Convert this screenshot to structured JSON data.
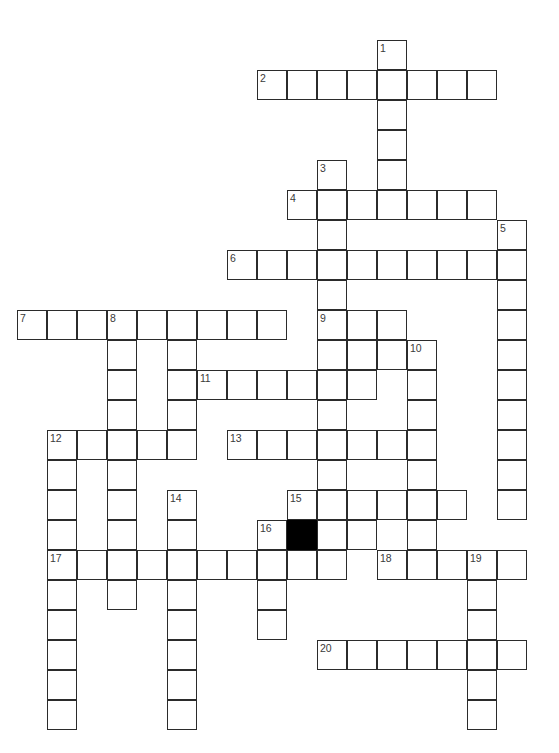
{
  "puzzle": {
    "kind": "crossword-grid",
    "title": "",
    "geometry": {
      "origin_x": 17,
      "origin_y": 40,
      "cell_size": 30,
      "cols": 18,
      "rows": 24,
      "border_color": "#2b2b2b",
      "cell_fill": "#ffffff",
      "block_fill": "#000000",
      "page_background": "#ffffff"
    },
    "entries": [
      {
        "number": "1",
        "direction": "down",
        "row": 0,
        "col": 12,
        "length": 7
      },
      {
        "number": "2",
        "direction": "across",
        "row": 1,
        "col": 8,
        "length": 8
      },
      {
        "number": "3",
        "direction": "down",
        "row": 4,
        "col": 10,
        "length": 8
      },
      {
        "number": "4",
        "direction": "across",
        "row": 5,
        "col": 9,
        "length": 7
      },
      {
        "number": "5",
        "direction": "down",
        "row": 6,
        "col": 16,
        "length": 10
      },
      {
        "number": "6",
        "direction": "across",
        "row": 7,
        "col": 7,
        "length": 10
      },
      {
        "number": "7",
        "direction": "across",
        "row": 9,
        "col": 0,
        "length": 9
      },
      {
        "number": "8",
        "direction": "down",
        "row": 9,
        "col": 3,
        "length": 10
      },
      {
        "number": "9",
        "direction": "down",
        "row": 9,
        "col": 10,
        "length": 10
      },
      {
        "number": "10",
        "direction": "down",
        "row": 10,
        "col": 13,
        "length": 9
      },
      {
        "number": "11",
        "direction": "across",
        "row": 11,
        "col": 6,
        "length": 6
      },
      {
        "number": "12",
        "direction": "across",
        "row": 13,
        "col": 1,
        "length": 5
      },
      {
        "number": "12",
        "direction": "down",
        "row": 13,
        "col": 1,
        "length": 10
      },
      {
        "number": "13",
        "direction": "across",
        "row": 13,
        "col": 7,
        "length": 6
      },
      {
        "number": "14",
        "direction": "down",
        "row": 15,
        "col": 5,
        "length": 10
      },
      {
        "number": "15",
        "direction": "across",
        "row": 15,
        "col": 9,
        "length": 6
      },
      {
        "number": "16",
        "direction": "across",
        "row": 16,
        "col": 8,
        "length": 4
      },
      {
        "number": "17",
        "direction": "across",
        "row": 17,
        "col": 1,
        "length": 10
      },
      {
        "number": "18",
        "direction": "across",
        "row": 17,
        "col": 12,
        "length": 5
      },
      {
        "number": "19",
        "direction": "down",
        "row": 17,
        "col": 15,
        "length": 7
      },
      {
        "number": "20",
        "direction": "across",
        "row": 20,
        "col": 10,
        "length": 7
      }
    ],
    "blocks": [
      {
        "row": 16,
        "col": 9
      }
    ],
    "cells": [
      {
        "row": 0,
        "col": 12,
        "number": "1"
      },
      {
        "row": 1,
        "col": 8,
        "number": "2"
      },
      {
        "row": 1,
        "col": 9
      },
      {
        "row": 1,
        "col": 10
      },
      {
        "row": 1,
        "col": 11
      },
      {
        "row": 1,
        "col": 12
      },
      {
        "row": 1,
        "col": 13
      },
      {
        "row": 1,
        "col": 14
      },
      {
        "row": 1,
        "col": 15
      },
      {
        "row": 2,
        "col": 12
      },
      {
        "row": 3,
        "col": 12
      },
      {
        "row": 4,
        "col": 10,
        "number": "3"
      },
      {
        "row": 4,
        "col": 12
      },
      {
        "row": 5,
        "col": 9,
        "number": "4"
      },
      {
        "row": 5,
        "col": 10
      },
      {
        "row": 5,
        "col": 11
      },
      {
        "row": 5,
        "col": 12
      },
      {
        "row": 5,
        "col": 13
      },
      {
        "row": 5,
        "col": 14
      },
      {
        "row": 5,
        "col": 15
      },
      {
        "row": 6,
        "col": 10
      },
      {
        "row": 6,
        "col": 16,
        "number": "5"
      },
      {
        "row": 7,
        "col": 7,
        "number": "6"
      },
      {
        "row": 7,
        "col": 8
      },
      {
        "row": 7,
        "col": 9
      },
      {
        "row": 7,
        "col": 10
      },
      {
        "row": 7,
        "col": 11
      },
      {
        "row": 7,
        "col": 12
      },
      {
        "row": 7,
        "col": 13
      },
      {
        "row": 7,
        "col": 14
      },
      {
        "row": 7,
        "col": 15
      },
      {
        "row": 7,
        "col": 16
      },
      {
        "row": 8,
        "col": 10
      },
      {
        "row": 8,
        "col": 16
      },
      {
        "row": 9,
        "col": 0,
        "number": "7"
      },
      {
        "row": 9,
        "col": 1
      },
      {
        "row": 9,
        "col": 2
      },
      {
        "row": 9,
        "col": 3,
        "number": "8"
      },
      {
        "row": 9,
        "col": 4
      },
      {
        "row": 9,
        "col": 5
      },
      {
        "row": 9,
        "col": 6
      },
      {
        "row": 9,
        "col": 7
      },
      {
        "row": 9,
        "col": 8
      },
      {
        "row": 9,
        "col": 10,
        "number": "9"
      },
      {
        "row": 9,
        "col": 11
      },
      {
        "row": 9,
        "col": 12
      },
      {
        "row": 9,
        "col": 16
      },
      {
        "row": 10,
        "col": 3
      },
      {
        "row": 10,
        "col": 5
      },
      {
        "row": 10,
        "col": 10
      },
      {
        "row": 10,
        "col": 11
      },
      {
        "row": 10,
        "col": 12
      },
      {
        "row": 10,
        "col": 13,
        "number": "10"
      },
      {
        "row": 10,
        "col": 16
      },
      {
        "row": 11,
        "col": 3
      },
      {
        "row": 11,
        "col": 5
      },
      {
        "row": 11,
        "col": 6,
        "number": "11"
      },
      {
        "row": 11,
        "col": 7
      },
      {
        "row": 11,
        "col": 8
      },
      {
        "row": 11,
        "col": 9
      },
      {
        "row": 11,
        "col": 10
      },
      {
        "row": 11,
        "col": 11
      },
      {
        "row": 11,
        "col": 13
      },
      {
        "row": 11,
        "col": 16
      },
      {
        "row": 12,
        "col": 3
      },
      {
        "row": 12,
        "col": 5
      },
      {
        "row": 12,
        "col": 10
      },
      {
        "row": 12,
        "col": 13
      },
      {
        "row": 12,
        "col": 16
      },
      {
        "row": 13,
        "col": 1,
        "number": "12"
      },
      {
        "row": 13,
        "col": 2
      },
      {
        "row": 13,
        "col": 3
      },
      {
        "row": 13,
        "col": 4
      },
      {
        "row": 13,
        "col": 5
      },
      {
        "row": 13,
        "col": 7,
        "number": "13"
      },
      {
        "row": 13,
        "col": 8
      },
      {
        "row": 13,
        "col": 9
      },
      {
        "row": 13,
        "col": 10
      },
      {
        "row": 13,
        "col": 11
      },
      {
        "row": 13,
        "col": 12
      },
      {
        "row": 13,
        "col": 13
      },
      {
        "row": 13,
        "col": 16
      },
      {
        "row": 14,
        "col": 1
      },
      {
        "row": 14,
        "col": 3
      },
      {
        "row": 14,
        "col": 10
      },
      {
        "row": 14,
        "col": 13
      },
      {
        "row": 14,
        "col": 16
      },
      {
        "row": 15,
        "col": 1
      },
      {
        "row": 15,
        "col": 3
      },
      {
        "row": 15,
        "col": 5,
        "number": "14"
      },
      {
        "row": 15,
        "col": 9,
        "number": "15"
      },
      {
        "row": 15,
        "col": 10
      },
      {
        "row": 15,
        "col": 11
      },
      {
        "row": 15,
        "col": 12
      },
      {
        "row": 15,
        "col": 13
      },
      {
        "row": 15,
        "col": 14
      },
      {
        "row": 15,
        "col": 16
      },
      {
        "row": 16,
        "col": 1
      },
      {
        "row": 16,
        "col": 3
      },
      {
        "row": 16,
        "col": 5
      },
      {
        "row": 16,
        "col": 8,
        "number": "16"
      },
      {
        "row": 16,
        "col": 10
      },
      {
        "row": 16,
        "col": 11
      },
      {
        "row": 16,
        "col": 13
      },
      {
        "row": 17,
        "col": 1,
        "number": "17"
      },
      {
        "row": 17,
        "col": 2
      },
      {
        "row": 17,
        "col": 3
      },
      {
        "row": 17,
        "col": 4
      },
      {
        "row": 17,
        "col": 5
      },
      {
        "row": 17,
        "col": 6
      },
      {
        "row": 17,
        "col": 7
      },
      {
        "row": 17,
        "col": 8
      },
      {
        "row": 17,
        "col": 9
      },
      {
        "row": 17,
        "col": 10
      },
      {
        "row": 17,
        "col": 12,
        "number": "18"
      },
      {
        "row": 17,
        "col": 13
      },
      {
        "row": 17,
        "col": 14
      },
      {
        "row": 17,
        "col": 15,
        "number": "19"
      },
      {
        "row": 17,
        "col": 16
      },
      {
        "row": 18,
        "col": 1
      },
      {
        "row": 18,
        "col": 3
      },
      {
        "row": 18,
        "col": 5
      },
      {
        "row": 18,
        "col": 8
      },
      {
        "row": 18,
        "col": 15
      },
      {
        "row": 19,
        "col": 1
      },
      {
        "row": 19,
        "col": 5
      },
      {
        "row": 19,
        "col": 8
      },
      {
        "row": 19,
        "col": 15
      },
      {
        "row": 20,
        "col": 1
      },
      {
        "row": 20,
        "col": 5
      },
      {
        "row": 20,
        "col": 10,
        "number": "20"
      },
      {
        "row": 20,
        "col": 11
      },
      {
        "row": 20,
        "col": 12
      },
      {
        "row": 20,
        "col": 13
      },
      {
        "row": 20,
        "col": 14
      },
      {
        "row": 20,
        "col": 15
      },
      {
        "row": 20,
        "col": 16
      },
      {
        "row": 21,
        "col": 1
      },
      {
        "row": 21,
        "col": 5
      },
      {
        "row": 21,
        "col": 15
      },
      {
        "row": 22,
        "col": 1
      },
      {
        "row": 22,
        "col": 5
      },
      {
        "row": 22,
        "col": 15
      }
    ]
  }
}
